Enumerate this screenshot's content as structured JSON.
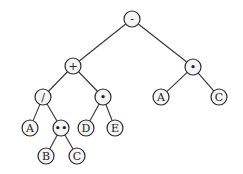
{
  "diagram": {
    "type": "expression-tree",
    "nodes": [
      {
        "id": "n0",
        "label": "-",
        "x": 132,
        "y": 19
      },
      {
        "id": "n1",
        "label": "+",
        "x": 73,
        "y": 66
      },
      {
        "id": "n2",
        "label": "•",
        "x": 193,
        "y": 67
      },
      {
        "id": "n3",
        "label": "/",
        "x": 43,
        "y": 97
      },
      {
        "id": "n4",
        "label": "•",
        "x": 103,
        "y": 97
      },
      {
        "id": "n5",
        "label": "A",
        "x": 161,
        "y": 97
      },
      {
        "id": "n6",
        "label": "C",
        "x": 219,
        "y": 97
      },
      {
        "id": "n7",
        "label": "A",
        "x": 30,
        "y": 128
      },
      {
        "id": "n8",
        "label": "••",
        "x": 61,
        "y": 128
      },
      {
        "id": "n9",
        "label": "D",
        "x": 86,
        "y": 128
      },
      {
        "id": "n10",
        "label": "E",
        "x": 115,
        "y": 128
      },
      {
        "id": "n11",
        "label": "B",
        "x": 46,
        "y": 156
      },
      {
        "id": "n12",
        "label": "C",
        "x": 77,
        "y": 156
      }
    ],
    "edges": [
      [
        "n0",
        "n1"
      ],
      [
        "n0",
        "n2"
      ],
      [
        "n1",
        "n3"
      ],
      [
        "n1",
        "n4"
      ],
      [
        "n2",
        "n5"
      ],
      [
        "n2",
        "n6"
      ],
      [
        "n3",
        "n7"
      ],
      [
        "n3",
        "n8"
      ],
      [
        "n4",
        "n9"
      ],
      [
        "n4",
        "n10"
      ],
      [
        "n8",
        "n11"
      ],
      [
        "n8",
        "n12"
      ]
    ],
    "node_radius": 8
  }
}
